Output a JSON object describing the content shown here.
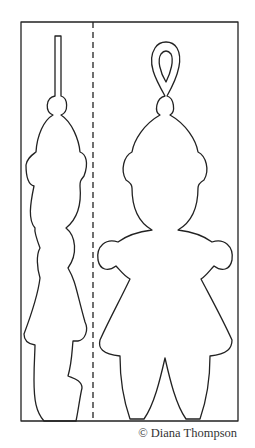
{
  "figure": {
    "credit": "© Diana Thompson",
    "line_color": "#222222",
    "fold_line_style": "dashed"
  }
}
